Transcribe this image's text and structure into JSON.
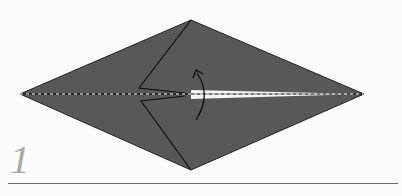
{
  "diagram": {
    "step_number": "1",
    "paper_color": "#585858",
    "background_color": "#fcfcfc",
    "fold_line": "valley fold (dashed) along center",
    "arrow": "curved arrow, fold upward",
    "caption_partial": "(caption text cut off at bottom edge)"
  }
}
